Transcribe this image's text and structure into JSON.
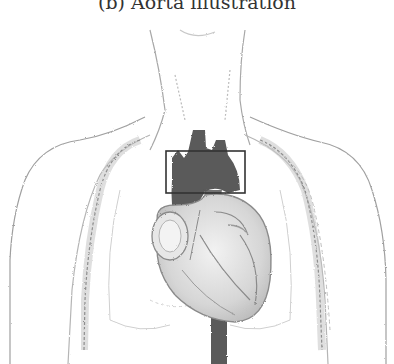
{
  "figure": {
    "caption": "(b) Aorta illustration",
    "subfigure_label": "(b)",
    "title": "Aorta illustration",
    "illustration": {
      "subject": "thorax with heart and aorta",
      "highlight_color": "#5a5a5a",
      "line_color": "#9a9a9a",
      "bounding_box": {
        "x": 166,
        "y": 151,
        "width": 79,
        "height": 42,
        "stroke": "#333333"
      }
    }
  }
}
